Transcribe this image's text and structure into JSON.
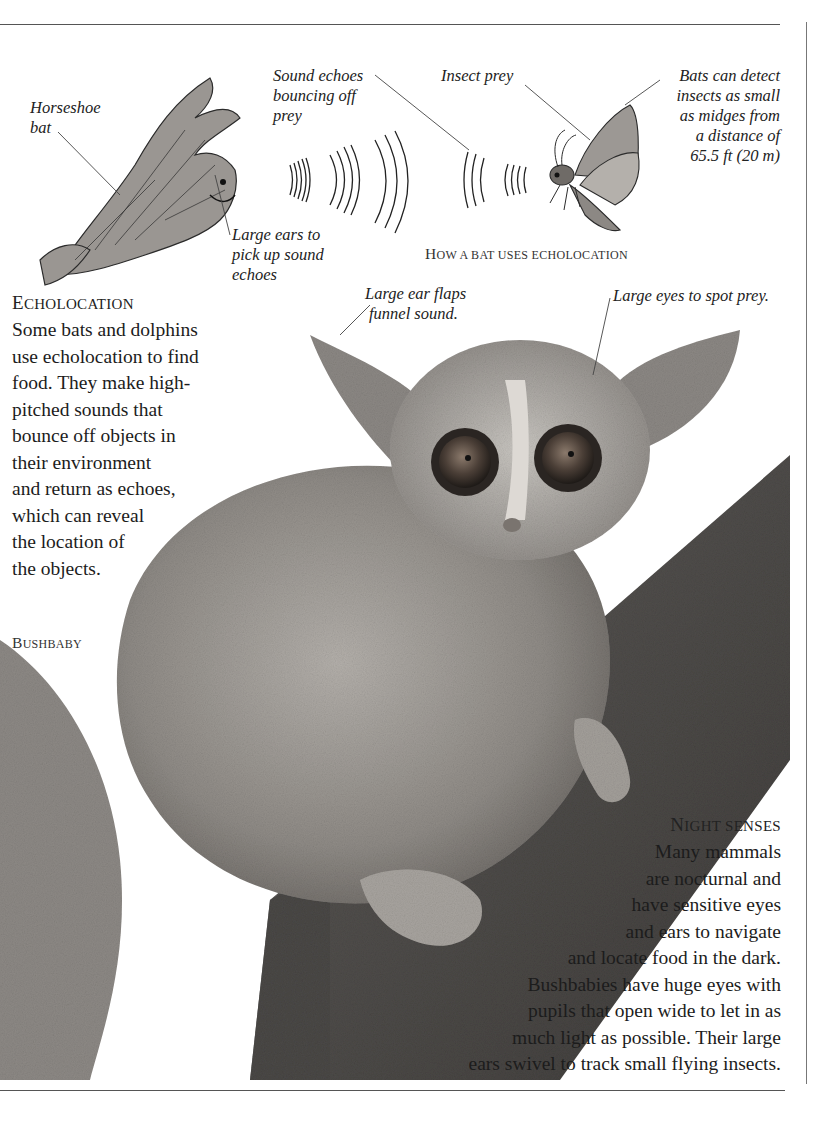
{
  "page": {
    "background": "#ffffff",
    "text_color": "#1c1c1c",
    "rule_color": "#555555"
  },
  "diagram": {
    "caption": "How a bat uses echolocation",
    "labels": {
      "horseshoe_bat": [
        "Horseshoe",
        "bat"
      ],
      "sound_echoes": [
        "Sound echoes",
        "bouncing off",
        "prey"
      ],
      "insect_prey": [
        "Insect prey"
      ],
      "detect_distance": [
        "Bats can detect",
        "insects as small",
        "as midges from",
        "a distance of",
        "65.5 ft (20 m)"
      ],
      "large_ears": [
        "Large ears to",
        "pick up sound",
        "echoes"
      ]
    },
    "icons": [
      "bat-illustration",
      "sound-wave-icon",
      "moth-illustration"
    ]
  },
  "echolocation": {
    "heading": "Echolocation",
    "lines": [
      "Some bats and dolphins",
      "use echolocation to find",
      "food. They make high-",
      "pitched sounds that",
      "bounce off objects in",
      "their environment",
      "and return as echoes,",
      "which can reveal",
      "the location of",
      "the objects."
    ]
  },
  "photo": {
    "caption": "Bushbaby",
    "labels": {
      "ear_flaps": [
        "Large ear flaps",
        "funnel sound."
      ],
      "eyes": [
        "Large eyes to spot prey."
      ]
    }
  },
  "night_senses": {
    "heading": "Night senses",
    "lines": [
      "Many mammals",
      "are nocturnal and",
      "have sensitive eyes",
      "and ears to navigate",
      "and locate food in the dark.",
      "Bushbabies have huge eyes with",
      "pupils that open wide to let in as",
      "much light as possible. Their large",
      "ears swivel to track small flying insects."
    ]
  }
}
